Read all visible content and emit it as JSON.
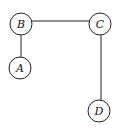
{
  "diagram": {
    "type": "graph",
    "nodes": [
      {
        "id": "B",
        "label": "B",
        "cx": 21,
        "cy": 24,
        "r": 11
      },
      {
        "id": "C",
        "label": "C",
        "cx": 100,
        "cy": 24,
        "r": 11
      },
      {
        "id": "A",
        "label": "A",
        "cx": 20,
        "cy": 68,
        "r": 11
      },
      {
        "id": "D",
        "label": "D",
        "cx": 99,
        "cy": 111,
        "r": 11
      }
    ],
    "edges": [
      {
        "from": "B",
        "to": "C"
      },
      {
        "from": "B",
        "to": "A"
      },
      {
        "from": "C",
        "to": "D"
      }
    ],
    "colors": {
      "stroke": "#222222",
      "background": "#ffffff"
    }
  }
}
